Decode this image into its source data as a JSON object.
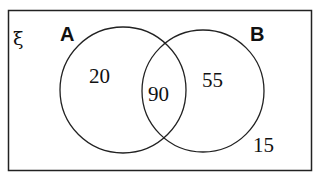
{
  "diagram": {
    "type": "venn",
    "universal_symbol": "ξ",
    "sets": [
      {
        "label": "A"
      },
      {
        "label": "B"
      }
    ],
    "regions": {
      "a_only": "20",
      "a_and_b": "90",
      "b_only": "55",
      "neither": "15"
    },
    "colors": {
      "stroke": "#222222",
      "background": "#ffffff"
    }
  }
}
